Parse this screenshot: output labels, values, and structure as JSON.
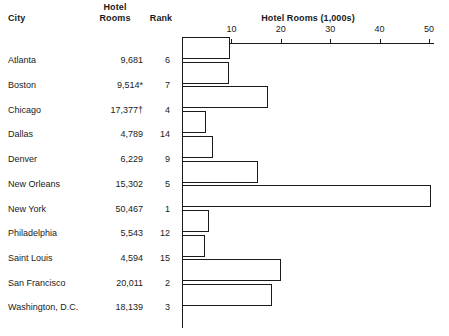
{
  "table": {
    "headers": {
      "city": "City",
      "rooms": "Hotel\nRooms",
      "rank": "Rank"
    },
    "rows": [
      {
        "city": "Atlanta",
        "rooms_label": "9,681",
        "rooms_value": 9681,
        "rank": "6"
      },
      {
        "city": "Boston",
        "rooms_label": "9,514*",
        "rooms_value": 9514,
        "rank": "7"
      },
      {
        "city": "Chicago",
        "rooms_label": "17,377†",
        "rooms_value": 17377,
        "rank": "4"
      },
      {
        "city": "Dallas",
        "rooms_label": "4,789",
        "rooms_value": 4789,
        "rank": "14"
      },
      {
        "city": "Denver",
        "rooms_label": "6,229",
        "rooms_value": 6229,
        "rank": "9"
      },
      {
        "city": "New Orleans",
        "rooms_label": "15,302",
        "rooms_value": 15302,
        "rank": "5"
      },
      {
        "city": "New York",
        "rooms_label": "50,467",
        "rooms_value": 50467,
        "rank": "1"
      },
      {
        "city": "Philadelphia",
        "rooms_label": "5,543",
        "rooms_value": 5543,
        "rank": "12"
      },
      {
        "city": "Saint Louis",
        "rooms_label": "4,594",
        "rooms_value": 4594,
        "rank": "15"
      },
      {
        "city": "San Francisco",
        "rooms_label": "20,011",
        "rooms_value": 20011,
        "rank": "2"
      },
      {
        "city": "Washington, D.C.",
        "rooms_label": "18,139",
        "rooms_value": 18139,
        "rank": "3"
      }
    ]
  },
  "chart_data": {
    "type": "bar",
    "orientation": "horizontal",
    "title": "Hotel Rooms (1,000s)",
    "xlabel": "Hotel Rooms (1,000s)",
    "ylabel": "",
    "categories": [
      "Atlanta",
      "Boston",
      "Chicago",
      "Dallas",
      "Denver",
      "New Orleans",
      "New York",
      "Philadelphia",
      "Saint Louis",
      "San Francisco",
      "Washington, D.C."
    ],
    "values": [
      9681,
      9514,
      17377,
      4789,
      6229,
      15302,
      50467,
      5543,
      4594,
      20011,
      18139
    ],
    "value_unit": "rooms",
    "axis_unit_divisor": 1000,
    "xlim": [
      0,
      51
    ],
    "xticks": [
      10,
      20,
      30,
      40,
      50
    ],
    "xtick_labels": [
      "10",
      "20",
      "30",
      "40",
      "50"
    ],
    "grid": false,
    "legend": null,
    "bar_fill": "#ffffff",
    "bar_stroke": "#1a1a1a",
    "annotations": [
      {
        "category": "Boston",
        "marker": "*"
      },
      {
        "category": "Chicago",
        "marker": "†"
      }
    ]
  },
  "colors": {
    "text": "#1a1a1a",
    "background": "#ffffff",
    "axis": "#1a1a1a"
  }
}
